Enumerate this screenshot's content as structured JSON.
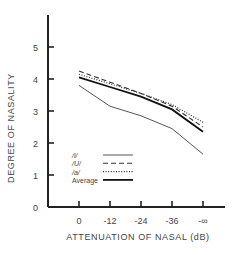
{
  "chart_data": {
    "type": "line",
    "title": "",
    "xlabel": "ATTENUATION OF NASAL (dB)",
    "ylabel": "DEGREE OF NASALITY",
    "categories": [
      "0",
      "-12",
      "-24",
      "-36",
      "-∞"
    ],
    "ylim": [
      0,
      6
    ],
    "yticks": [
      "0",
      "1",
      "2",
      "3",
      "4",
      "5"
    ],
    "grid": false,
    "legend_position": "lower-left inside plot",
    "series": [
      {
        "name": "/i/",
        "style": "solid-thin",
        "values": [
          3.8,
          3.15,
          2.85,
          2.45,
          1.65
        ]
      },
      {
        "name": "/U/",
        "style": "dashed",
        "values": [
          4.25,
          3.9,
          3.55,
          3.15,
          2.5
        ]
      },
      {
        "name": "/a/",
        "style": "dotted",
        "values": [
          4.15,
          3.85,
          3.55,
          3.2,
          2.65
        ]
      },
      {
        "name": "Average",
        "style": "solid-thick",
        "values": [
          4.05,
          3.75,
          3.45,
          3.05,
          2.35
        ]
      }
    ]
  }
}
